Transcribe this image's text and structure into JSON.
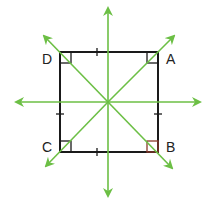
{
  "figure": {
    "vertices": [
      {
        "label": "D",
        "x": 60,
        "y": 52,
        "label_x": 42,
        "label_y": 64
      },
      {
        "label": "A",
        "x": 158,
        "y": 52,
        "label_x": 166,
        "label_y": 64
      },
      {
        "label": "B",
        "x": 158,
        "y": 152,
        "label_x": 166,
        "label_y": 152
      },
      {
        "label": "C",
        "x": 60,
        "y": 152,
        "label_x": 42,
        "label_y": 152
      }
    ],
    "center": {
      "x": 108,
      "y": 102
    },
    "symmetry_lines": [
      {
        "name": "vertical",
        "x1": 108,
        "y1": 196,
        "x2": 108,
        "y2": 8
      },
      {
        "name": "horizontal",
        "x1": 16,
        "y1": 102,
        "x2": 200,
        "y2": 102
      },
      {
        "name": "diagonal-CA",
        "x1": 46,
        "y1": 166,
        "x2": 174,
        "y2": 36
      },
      {
        "name": "diagonal-BD",
        "x1": 172,
        "y1": 168,
        "x2": 44,
        "y2": 36
      }
    ],
    "colors": {
      "square": "#1a1a1a",
      "symmetry": "#6cbf45",
      "label": "#222222"
    }
  }
}
